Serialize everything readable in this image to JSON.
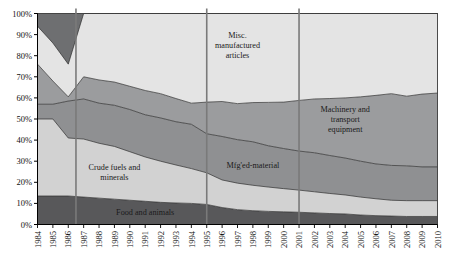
{
  "chart_data": {
    "type": "area",
    "title": "",
    "xlabel": "",
    "ylabel": "",
    "ylim": [
      0,
      100
    ],
    "y_is_percent": true,
    "stacked_percent": true,
    "grid": false,
    "legend_position": "inline-annotations",
    "categories": [
      "1984",
      "1985",
      "1986",
      "1987",
      "1988",
      "1989",
      "1990",
      "1991",
      "1992",
      "1993",
      "1994",
      "1995",
      "1996",
      "1997",
      "1998",
      "1999",
      "2000",
      "2001",
      "2002",
      "2003",
      "2004",
      "2005",
      "2006",
      "2007",
      "2008",
      "2009",
      "2010"
    ],
    "ytick_labels": [
      "0%",
      "10%",
      "20%",
      "30%",
      "40%",
      "50%",
      "60%",
      "70%",
      "80%",
      "90%",
      "100%"
    ],
    "ytick_values": [
      0,
      10,
      20,
      30,
      40,
      50,
      60,
      70,
      80,
      90,
      100
    ],
    "series": [
      {
        "name": "Food and animals",
        "values": [
          13.5,
          13.5,
          13.5,
          13.0,
          12.5,
          12.0,
          11.5,
          11.0,
          10.5,
          10.2,
          10.0,
          9.5,
          8.0,
          7.0,
          6.5,
          6.2,
          6.0,
          5.8,
          5.5,
          5.2,
          5.0,
          4.5,
          4.2,
          4.0,
          3.8,
          3.8,
          3.8
        ]
      },
      {
        "name": "Crude fuels and minerals",
        "values": [
          36.5,
          36.5,
          27.5,
          27.5,
          26.0,
          25.0,
          23.0,
          21.0,
          19.5,
          18.0,
          16.5,
          15.0,
          13.0,
          12.5,
          12.0,
          11.5,
          11.0,
          10.5,
          10.0,
          9.5,
          9.0,
          8.5,
          8.0,
          7.5,
          7.5,
          7.5,
          7.5
        ]
      },
      {
        "name": "Mfg'ed-material",
        "values": [
          7.0,
          7.0,
          17.5,
          19.0,
          19.0,
          19.5,
          20.0,
          20.0,
          20.5,
          20.5,
          21.0,
          18.5,
          20.5,
          20.5,
          20.5,
          19.5,
          19.0,
          18.5,
          18.5,
          18.0,
          17.5,
          17.0,
          16.5,
          16.5,
          16.5,
          16.0,
          16.0
        ]
      },
      {
        "name": "Machinery and transport equipment",
        "values": [
          19.0,
          11.0,
          2.0,
          10.5,
          11.0,
          11.0,
          11.0,
          11.5,
          11.5,
          11.0,
          10.0,
          15.0,
          16.5,
          17.0,
          18.5,
          20.5,
          22.0,
          24.0,
          25.5,
          27.0,
          28.5,
          30.5,
          32.5,
          34.0,
          33.0,
          34.5,
          35.0
        ]
      },
      {
        "name": "Misc. manufactured articles",
        "values": [
          18.0,
          18.0,
          15.5,
          30.0,
          31.5,
          32.5,
          34.5,
          36.5,
          38.0,
          40.3,
          42.5,
          42.0,
          41.5,
          42.5,
          42.0,
          42.0,
          42.0,
          41.2,
          40.5,
          40.3,
          40.0,
          39.5,
          38.8,
          38.0,
          39.2,
          38.2,
          37.7
        ]
      },
      {
        "name": "Other",
        "values": [
          6.0,
          14.0,
          24.0,
          0.0,
          0.0,
          0.0,
          0.0,
          0.0,
          0.0,
          0.0,
          0.0,
          0.0,
          0.0,
          0.0,
          0.0,
          0.0,
          0.0,
          0.0,
          0.0,
          0.0,
          0.0,
          0.0,
          0.0,
          0.0,
          0.0,
          0.0,
          0.0
        ]
      }
    ],
    "series_colors": [
      "#58585a",
      "#d2d2d2",
      "#8f9092",
      "#9b9c9e",
      "#e4e4e4",
      "#6e6f71"
    ],
    "annotations": [
      {
        "text_lines": [
          "Misc.",
          "manufactured",
          "articles"
        ],
        "x_year": 1997,
        "y_pct": 85,
        "name": "misc-manufactured-articles-label"
      },
      {
        "text_lines": [
          "Machinery and",
          "transport",
          "equipment"
        ],
        "x_year": 2004,
        "y_pct": 50,
        "name": "machinery-transport-label"
      },
      {
        "text_lines": [
          "Mfg'ed-material"
        ],
        "x_year": 1998,
        "y_pct": 28,
        "name": "mfged-material-label"
      },
      {
        "text_lines": [
          "Crude fuels and",
          "minerals"
        ],
        "x_year": 1989,
        "y_pct": 25,
        "name": "crude-fuels-minerals-label"
      },
      {
        "text_lines": [
          "Food and animals"
        ],
        "x_year": 1991,
        "y_pct": 6,
        "name": "food-and-animals-label"
      }
    ],
    "vertical_reference_lines": [
      {
        "x_year": 1986.5,
        "label": ""
      },
      {
        "x_year": 1995.0,
        "label": ""
      },
      {
        "x_year": 2001.0,
        "label": ""
      }
    ],
    "axis_colors": {
      "axis": "#000000",
      "vline": "#7a7a7a",
      "outline": "#3a3a3a"
    }
  }
}
